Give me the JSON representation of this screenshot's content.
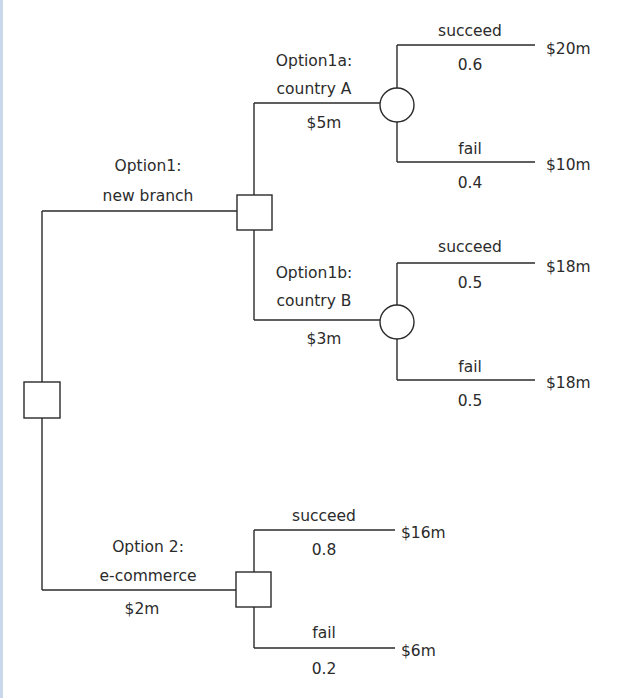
{
  "diagram": {
    "type": "decision-tree",
    "root": {
      "node_type": "decision"
    },
    "options": {
      "option1": {
        "title": "Option1:",
        "subtitle": "new branch",
        "node_type": "decision",
        "branches": {
          "a": {
            "title": "Option1a:",
            "subtitle": "country A",
            "cost": "$5m",
            "node_type": "chance",
            "outcomes": [
              {
                "label": "succeed",
                "probability": "0.6",
                "payoff": "$20m"
              },
              {
                "label": "fail",
                "probability": "0.4",
                "payoff": "$10m"
              }
            ]
          },
          "b": {
            "title": "Option1b:",
            "subtitle": "country B",
            "cost": "$3m",
            "node_type": "chance",
            "outcomes": [
              {
                "label": "succeed",
                "probability": "0.5",
                "payoff": "$18m"
              },
              {
                "label": "fail",
                "probability": "0.5",
                "payoff": "$18m"
              }
            ]
          }
        }
      },
      "option2": {
        "title": "Option 2:",
        "subtitle": "e-commerce",
        "cost": "$2m",
        "node_type": "decision",
        "outcomes": [
          {
            "label": "succeed",
            "probability": "0.8",
            "payoff": "$16m"
          },
          {
            "label": "fail",
            "probability": "0.2",
            "payoff": "$6m"
          }
        ]
      }
    }
  }
}
